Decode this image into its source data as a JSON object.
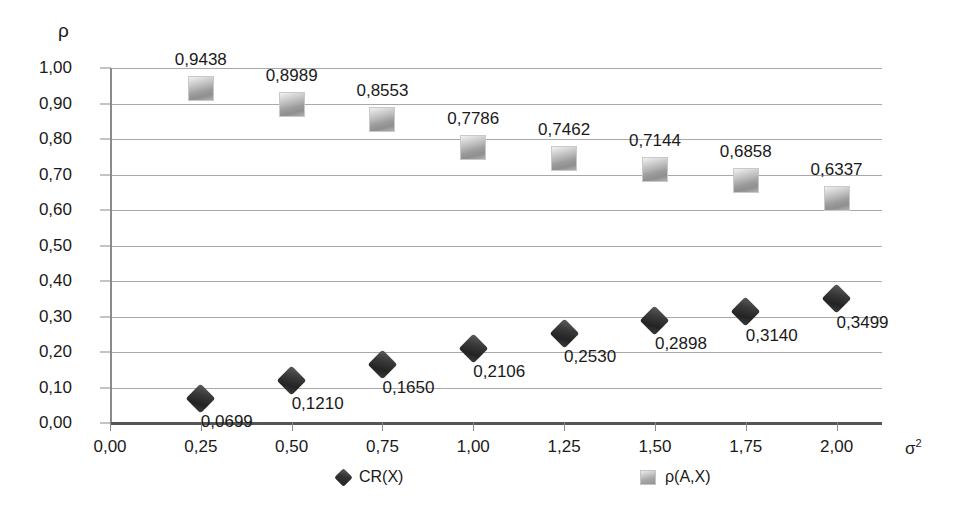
{
  "chart_data": {
    "type": "scatter",
    "title": "",
    "xlabel": "σ²",
    "ylabel": "ρ",
    "xlim": [
      0.0,
      2.125
    ],
    "ylim": [
      0.0,
      1.0
    ],
    "grid": true,
    "legend_position": "bottom",
    "x": [
      0.25,
      0.5,
      0.75,
      1.0,
      1.25,
      1.5,
      1.75,
      2.0
    ],
    "xtick_labels": [
      "0,00",
      "0,25",
      "0,50",
      "0,75",
      "1,00",
      "1,25",
      "1,50",
      "1,75",
      "2,00"
    ],
    "xtick_values": [
      0.0,
      0.25,
      0.5,
      0.75,
      1.0,
      1.25,
      1.5,
      1.75,
      2.0
    ],
    "ytick_labels": [
      "1,00",
      "0,90",
      "0,80",
      "0,70",
      "0,60",
      "0,50",
      "0,40",
      "0,30",
      "0,20",
      "0,10",
      "0,00"
    ],
    "ytick_values": [
      1.0,
      0.9,
      0.8,
      0.7,
      0.6,
      0.5,
      0.4,
      0.3,
      0.2,
      0.1,
      0.0
    ],
    "series": [
      {
        "name": "CR(X)",
        "marker": "diamond",
        "color": "#2b2b2b",
        "values": [
          0.0699,
          0.121,
          0.165,
          0.2106,
          0.253,
          0.2898,
          0.314,
          0.3499
        ],
        "labels": [
          "0,0699",
          "0,1210",
          "0,1650",
          "0,2106",
          "0,2530",
          "0,2898",
          "0,3140",
          "0,3499"
        ],
        "label_position": "below"
      },
      {
        "name": "ρ(A,X)",
        "marker": "square",
        "color": "#a8a8a8",
        "values": [
          0.9438,
          0.8989,
          0.8553,
          0.7786,
          0.7462,
          0.7144,
          0.6858,
          0.6337
        ],
        "labels": [
          "0,9438",
          "0,8989",
          "0,8553",
          "0,7786",
          "0,7462",
          "0,7144",
          "0,6858",
          "0,6337"
        ],
        "label_position": "above"
      }
    ]
  },
  "legend": {
    "items": [
      {
        "label": "CR(X)"
      },
      {
        "label": "ρ(A,X)"
      }
    ]
  },
  "axis": {
    "y_title": "ρ",
    "x_title_base": "σ",
    "x_title_exp": "2"
  }
}
